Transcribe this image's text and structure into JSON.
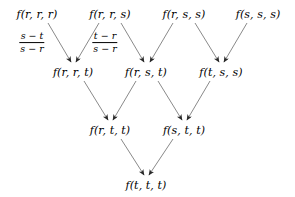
{
  "diagram": {
    "edge_color": "#6b6b6b",
    "text_color": "#000000",
    "background": "#ffffff",
    "rows": [
      {
        "name": "row-1",
        "y": 14,
        "nodes": [
          {
            "label": "f(r, r, r)",
            "x": 37
          },
          {
            "label": "f(r, r, s)",
            "x": 110
          },
          {
            "label": "f(r, s, s)",
            "x": 184
          },
          {
            "label": "f(s, s, s)",
            "x": 258
          }
        ]
      },
      {
        "name": "row-2",
        "y": 72,
        "nodes": [
          {
            "label": "f(r, r, t)",
            "x": 73
          },
          {
            "label": "f(r, s, t)",
            "x": 146
          },
          {
            "label": "f(t, s, s)",
            "x": 221
          }
        ]
      },
      {
        "name": "row-3",
        "y": 130,
        "nodes": [
          {
            "label": "f(r, t, t)",
            "x": 110
          },
          {
            "label": "f(s, t, t)",
            "x": 184
          }
        ]
      },
      {
        "name": "row-4",
        "y": 185,
        "nodes": [
          {
            "label": "f(t, t, t)",
            "x": 146
          }
        ]
      }
    ],
    "weights": [
      {
        "name": "weight-left",
        "numerator": "s − t",
        "denominator": "s − r",
        "x": 32,
        "y": 43
      },
      {
        "name": "weight-right",
        "numerator": "t − r",
        "denominator": "s − r",
        "x": 105,
        "y": 43
      }
    ],
    "edges": [
      {
        "from": "f(r, r, r)",
        "to": "f(r, r, t)",
        "x1": 48,
        "y1": 23,
        "x2": 71,
        "y2": 62
      },
      {
        "from": "f(r, r, s)",
        "to": "f(r, r, t)",
        "x1": 99,
        "y1": 23,
        "x2": 76,
        "y2": 62
      },
      {
        "from": "f(r, r, s)",
        "to": "f(r, s, t)",
        "x1": 121,
        "y1": 23,
        "x2": 144,
        "y2": 62
      },
      {
        "from": "f(r, s, s)",
        "to": "f(r, s, t)",
        "x1": 173,
        "y1": 23,
        "x2": 150,
        "y2": 62
      },
      {
        "from": "f(r, s, s)",
        "to": "f(t, s, s)",
        "x1": 195,
        "y1": 23,
        "x2": 219,
        "y2": 62
      },
      {
        "from": "f(s, s, s)",
        "to": "f(t, s, s)",
        "x1": 247,
        "y1": 23,
        "x2": 224,
        "y2": 62
      },
      {
        "from": "f(r, r, t)",
        "to": "f(r, t, t)",
        "x1": 84,
        "y1": 81,
        "x2": 108,
        "y2": 120
      },
      {
        "from": "f(r, s, t)",
        "to": "f(r, t, t)",
        "x1": 136,
        "y1": 81,
        "x2": 113,
        "y2": 120
      },
      {
        "from": "f(r, s, t)",
        "to": "f(s, t, t)",
        "x1": 158,
        "y1": 81,
        "x2": 182,
        "y2": 120
      },
      {
        "from": "f(t, s, s)",
        "to": "f(s, t, t)",
        "x1": 210,
        "y1": 81,
        "x2": 187,
        "y2": 120
      },
      {
        "from": "f(r, t, t)",
        "to": "f(t, t, t)",
        "x1": 121,
        "y1": 139,
        "x2": 144,
        "y2": 175
      },
      {
        "from": "f(s, t, t)",
        "to": "f(t, t, t)",
        "x1": 173,
        "y1": 139,
        "x2": 149,
        "y2": 175
      }
    ]
  }
}
